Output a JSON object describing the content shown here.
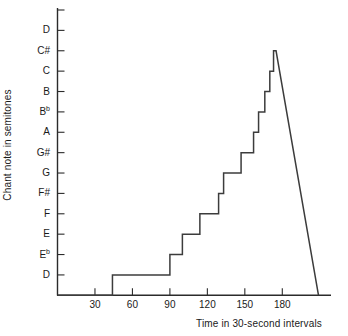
{
  "chart_data": {
    "type": "line",
    "title": "",
    "xlabel": "Time in 30-second intervals",
    "ylabel": "Chant note in semitones",
    "grid": false,
    "legend": null,
    "xlim": [
      0,
      219
    ],
    "ylim": [
      0,
      14
    ],
    "xticks": [
      30,
      60,
      90,
      120,
      150,
      180
    ],
    "xtick_labels": [
      "30",
      "60",
      "90",
      "120",
      "150",
      "180"
    ],
    "yticks": [
      1,
      2,
      3,
      4,
      5,
      6,
      7,
      8,
      9,
      10,
      11,
      12,
      13,
      14
    ],
    "ytick_labels": [
      {
        "text": "D",
        "accidental": ""
      },
      {
        "text": "E",
        "accidental": "b"
      },
      {
        "text": "E",
        "accidental": ""
      },
      {
        "text": "F",
        "accidental": ""
      },
      {
        "text": "F#",
        "accidental": ""
      },
      {
        "text": "G",
        "accidental": ""
      },
      {
        "text": "G#",
        "accidental": ""
      },
      {
        "text": "A",
        "accidental": ""
      },
      {
        "text": "B",
        "accidental": "b"
      },
      {
        "text": "B",
        "accidental": ""
      },
      {
        "text": "C",
        "accidental": ""
      },
      {
        "text": "C#",
        "accidental": ""
      },
      {
        "text": "D",
        "accidental": ""
      }
    ],
    "series": [
      {
        "name": "chant pitch",
        "style": "step-then-linear-fall",
        "note_names": [
          "D",
          "Eb",
          "E",
          "F",
          "F#",
          "G",
          "G#",
          "A",
          "Bb",
          "B",
          "C",
          "C#"
        ],
        "points": [
          {
            "x": 0,
            "y": 0,
            "note": ""
          },
          {
            "x": 44,
            "y": 0,
            "note": ""
          },
          {
            "x": 44,
            "y": 1,
            "note": "D"
          },
          {
            "x": 90,
            "y": 1,
            "note": "D"
          },
          {
            "x": 90,
            "y": 2,
            "note": "Eb"
          },
          {
            "x": 100,
            "y": 2,
            "note": "Eb"
          },
          {
            "x": 100,
            "y": 3,
            "note": "E"
          },
          {
            "x": 114,
            "y": 3,
            "note": "E"
          },
          {
            "x": 114,
            "y": 4,
            "note": "F"
          },
          {
            "x": 129,
            "y": 4,
            "note": "F"
          },
          {
            "x": 129,
            "y": 5,
            "note": "F#"
          },
          {
            "x": 133,
            "y": 5,
            "note": "F#"
          },
          {
            "x": 133,
            "y": 6,
            "note": "G"
          },
          {
            "x": 147,
            "y": 6,
            "note": "G"
          },
          {
            "x": 147,
            "y": 7,
            "note": "G#"
          },
          {
            "x": 157,
            "y": 7,
            "note": "G#"
          },
          {
            "x": 157,
            "y": 8,
            "note": "A"
          },
          {
            "x": 161,
            "y": 8,
            "note": "A"
          },
          {
            "x": 161,
            "y": 9,
            "note": "Bb"
          },
          {
            "x": 166,
            "y": 9,
            "note": "Bb"
          },
          {
            "x": 166,
            "y": 10,
            "note": "B"
          },
          {
            "x": 170,
            "y": 10,
            "note": "B"
          },
          {
            "x": 170,
            "y": 11,
            "note": "C"
          },
          {
            "x": 173,
            "y": 11,
            "note": "C"
          },
          {
            "x": 173,
            "y": 12,
            "note": "C#"
          },
          {
            "x": 175,
            "y": 12,
            "note": "C#"
          },
          {
            "x": 209,
            "y": 0,
            "note": ""
          }
        ]
      }
    ],
    "line_color": "#3c3c3c",
    "axis_color": "#2b2b2b"
  }
}
